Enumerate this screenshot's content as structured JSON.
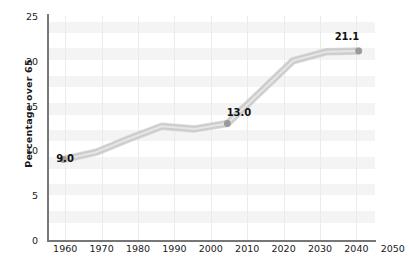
{
  "chart_data": {
    "type": "line",
    "title": "",
    "xlabel": "",
    "ylabel": "Percentage over 65",
    "x": [
      1960,
      1970,
      1980,
      1990,
      2000,
      2010,
      2020,
      2030,
      2040,
      2050
    ],
    "categories": [
      "1960",
      "1970",
      "1980",
      "1990",
      "2000",
      "2010",
      "2020",
      "2030",
      "2040",
      "2050"
    ],
    "values": [
      9.0,
      9.8,
      11.3,
      12.7,
      12.4,
      13.0,
      16.5,
      20.0,
      21.0,
      21.1
    ],
    "series": [
      {
        "name": "Percentage over 65",
        "values": [
          9.0,
          9.8,
          11.3,
          12.7,
          12.4,
          13.0,
          16.5,
          20.0,
          21.0,
          21.1
        ]
      }
    ],
    "ylim": [
      0,
      25
    ],
    "xlim": [
      1955,
      2055
    ],
    "yticks": [
      0,
      5,
      10,
      15,
      20,
      25
    ],
    "ytick_labels": [
      "0",
      "5",
      "10",
      "15",
      "20",
      "25"
    ],
    "xtick_labels": [
      "1960",
      "1970",
      "1980",
      "1990",
      "2000",
      "2010",
      "2020",
      "2030",
      "2040",
      "2050"
    ],
    "grid": "vertical-only-faint",
    "legend": "none",
    "annotations": [
      {
        "label": "9.0",
        "x": 1960,
        "y": 9.0
      },
      {
        "label": "13.0",
        "x": 2010,
        "y": 13.0
      },
      {
        "label": "21.1",
        "x": 2050,
        "y": 21.1
      }
    ],
    "markers": [
      {
        "x": 1960,
        "y": 9.0
      },
      {
        "x": 2010,
        "y": 13.0
      },
      {
        "x": 2050,
        "y": 21.1
      }
    ],
    "colors": {
      "line": "#c9c9c9",
      "line_highlight": "#e8e8e8",
      "marker": "#9a9a9a",
      "axis": "#777777",
      "gridline": "#ebebeb",
      "band": "#f4f4f4",
      "text": "#1a1a1a",
      "background": "#ffffff"
    }
  }
}
